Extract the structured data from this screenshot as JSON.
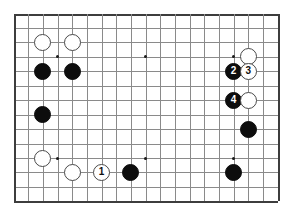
{
  "figure": {
    "background_color": "#ffffff",
    "line_color": "#8a8a8a",
    "edge_color": "#3d3d3d",
    "black_color": "#0d0d0d",
    "white_color": "#ffffff"
  },
  "board": {
    "columns": 19,
    "rows": 14,
    "origin_x": 13.5,
    "origin_y": 13.5,
    "spacing_x": 14.67,
    "spacing_y": 14.45,
    "star_points": [
      {
        "col": 3,
        "row": 3
      },
      {
        "col": 9,
        "row": 3
      },
      {
        "col": 15,
        "row": 3
      },
      {
        "col": 3,
        "row": 10
      },
      {
        "col": 9,
        "row": 10
      },
      {
        "col": 15,
        "row": 10
      }
    ]
  },
  "stones": [
    {
      "id": "white-c2r2",
      "color": "white",
      "col": 2,
      "row": 2,
      "label": ""
    },
    {
      "id": "white-c4r2",
      "color": "white",
      "col": 4,
      "row": 2,
      "label": ""
    },
    {
      "id": "black-c2r4",
      "color": "black",
      "col": 2,
      "row": 4,
      "label": ""
    },
    {
      "id": "black-c4r4",
      "color": "black",
      "col": 4,
      "row": 4,
      "label": ""
    },
    {
      "id": "black-c2r7",
      "color": "black",
      "col": 2,
      "row": 7,
      "label": ""
    },
    {
      "id": "white-c2r10",
      "color": "white",
      "col": 2,
      "row": 10,
      "label": ""
    },
    {
      "id": "white-c4r11",
      "color": "white",
      "col": 4,
      "row": 11,
      "label": ""
    },
    {
      "id": "white-move-1",
      "color": "white",
      "col": 6,
      "row": 11,
      "label": "1"
    },
    {
      "id": "black-c8r11",
      "color": "black",
      "col": 8,
      "row": 11,
      "label": ""
    },
    {
      "id": "white-c16r3",
      "color": "white",
      "col": 16,
      "row": 3,
      "label": ""
    },
    {
      "id": "black-move-2",
      "color": "black",
      "col": 15,
      "row": 4,
      "label": "2"
    },
    {
      "id": "white-move-3",
      "color": "white",
      "col": 16,
      "row": 4,
      "label": "3"
    },
    {
      "id": "black-move-4",
      "color": "black",
      "col": 15,
      "row": 6,
      "label": "4"
    },
    {
      "id": "white-c16r6",
      "color": "white",
      "col": 16,
      "row": 6,
      "label": ""
    },
    {
      "id": "black-c16r8",
      "color": "black",
      "col": 16,
      "row": 8,
      "label": ""
    },
    {
      "id": "black-c15r11",
      "color": "black",
      "col": 15,
      "row": 11,
      "label": ""
    }
  ]
}
